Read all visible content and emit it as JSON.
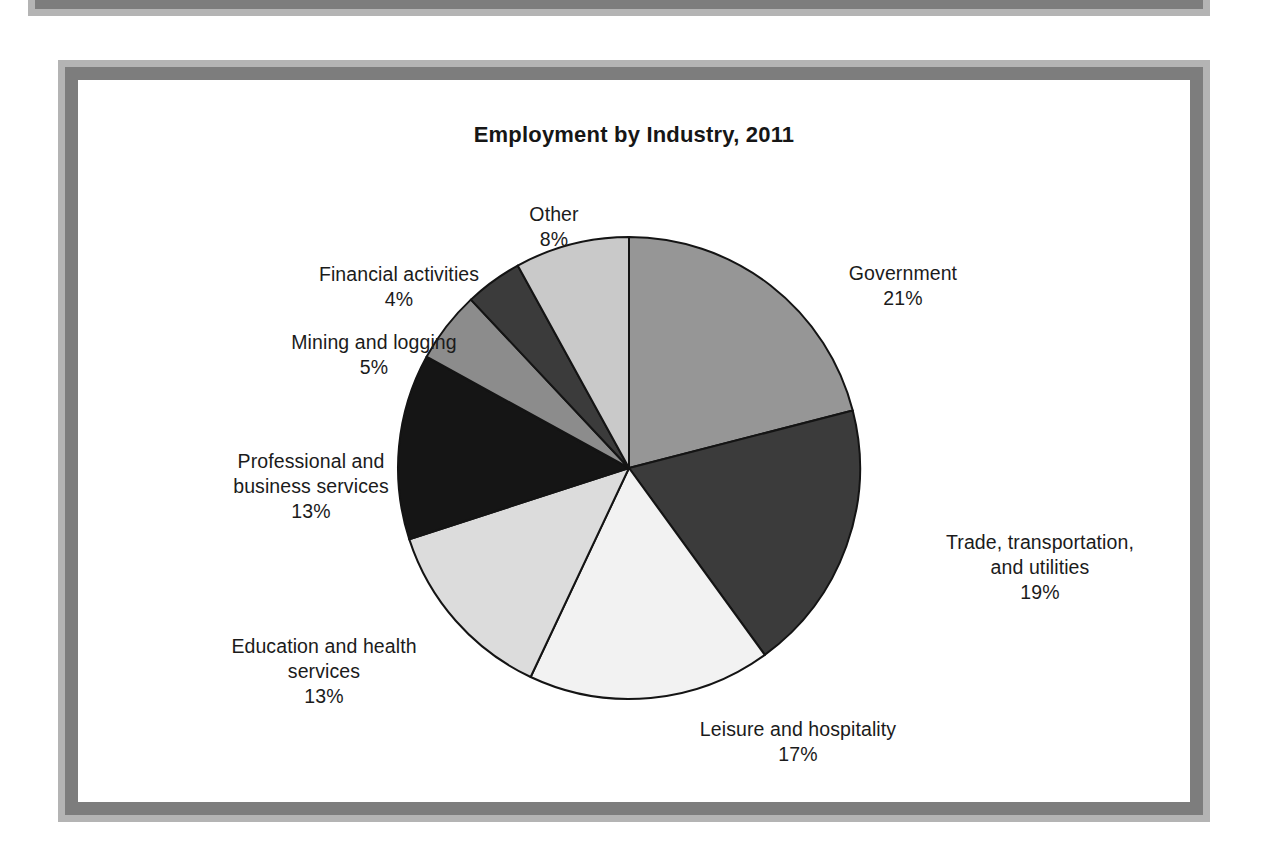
{
  "page": {
    "background_color": "#ffffff",
    "frame_outer_color": "#b4b4b4",
    "frame_inner_color": "#7d7d7d"
  },
  "chart_data": {
    "type": "pie",
    "title": "Employment by Industry, 2011",
    "xlabel": "",
    "ylabel": "",
    "legend_position": "none (direct callout labels)",
    "grid": false,
    "start_angle_deg": 0,
    "direction": "clockwise",
    "total_percent": 100,
    "categories": [
      "Government",
      "Trade, transportation, and utilities",
      "Leisure and hospitality",
      "Education and health services",
      "Professional and business services",
      "Mining and logging",
      "Financial activities",
      "Other"
    ],
    "values": [
      21,
      19,
      17,
      13,
      13,
      5,
      4,
      8
    ],
    "slices": [
      {
        "label": "Government",
        "label_lines": "Government\n21%",
        "value": 21,
        "value_text": "21%",
        "color": "#969696"
      },
      {
        "label": "Trade, transportation, and utilities",
        "label_lines": "Trade, transportation,\nand utilities\n19%",
        "value": 19,
        "value_text": "19%",
        "color": "#3b3b3b"
      },
      {
        "label": "Leisure and hospitality",
        "label_lines": "Leisure and hospitality\n17%",
        "value": 17,
        "value_text": "17%",
        "color": "#f2f2f2"
      },
      {
        "label": "Education and health services",
        "label_lines": "Education and health\nservices\n13%",
        "value": 13,
        "value_text": "13%",
        "color": "#dcdcdc"
      },
      {
        "label": "Professional and business services",
        "label_lines": "Professional and\nbusiness services\n13%",
        "value": 13,
        "value_text": "13%",
        "color": "#151515"
      },
      {
        "label": "Mining and logging",
        "label_lines": "Mining and logging\n5%",
        "value": 5,
        "value_text": "5%",
        "color": "#8c8c8c"
      },
      {
        "label": "Financial activities",
        "label_lines": "Financial activities\n4%",
        "value": 4,
        "value_text": "4%",
        "color": "#3b3b3b"
      },
      {
        "label": "Other",
        "label_lines": "Other\n8%",
        "value": 8,
        "value_text": "8%",
        "color": "#c9c9c9"
      }
    ]
  }
}
